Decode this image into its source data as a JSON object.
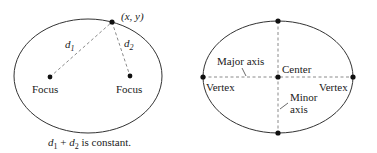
{
  "left_diagram": {
    "point_label": "(x, y)",
    "d1_label": "d",
    "d1_sub": "1",
    "d2_label": "d",
    "d2_sub": "2",
    "focus_left_label": "Focus",
    "focus_right_label": "Focus",
    "caption": {
      "d1": "d",
      "d1_sub": "1",
      "plus": " + ",
      "d2": "d",
      "d2_sub": "2",
      "rest": " is constant."
    }
  },
  "right_diagram": {
    "major_axis_label": "Major axis",
    "center_label": "Center",
    "vertex_left_label": "Vertex",
    "vertex_right_label": "Vertex",
    "minor_axis_label_line1": "Minor",
    "minor_axis_label_line2": "axis"
  },
  "colors": {
    "curve": "#333333",
    "dashed": "#8a8a8a",
    "dot": "#111111",
    "text": "#1a1a1a"
  }
}
